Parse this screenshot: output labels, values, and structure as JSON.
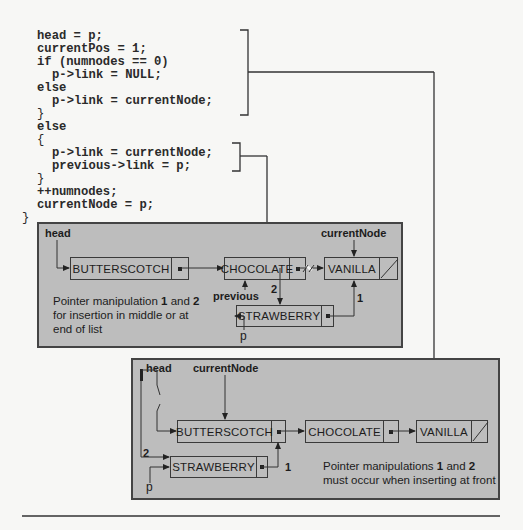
{
  "code": {
    "lines": [
      {
        "text": "head = p;",
        "indent": 1
      },
      {
        "text": "currentPos = 1;",
        "indent": 1
      },
      {
        "text": "if (numnodes == 0)",
        "indent": 1
      },
      {
        "text": "p->link = NULL;",
        "indent": 2
      },
      {
        "text": "else",
        "indent": 1
      },
      {
        "text": "p->link = currentNode;",
        "indent": 2
      },
      {
        "text": "}",
        "indent": 0
      },
      {
        "text": "else",
        "indent": 0
      },
      {
        "text": "{",
        "indent": 0
      },
      {
        "text": "p->link = currentNode;",
        "indent": 1
      },
      {
        "text": "previous->link = p;",
        "indent": 1
      },
      {
        "text": "}",
        "indent": 0
      },
      {
        "text": "++numnodes;",
        "indent": 0
      },
      {
        "text": "currentNode = p;",
        "indent": 0
      },
      {
        "text": "}",
        "indent": -1
      }
    ]
  },
  "middle_insert": {
    "head_label": "head",
    "current_node_label": "currentNode",
    "previous_label": "previous",
    "p_label": "p",
    "nodes": {
      "butterscotch": "BUTTERSCOTCH",
      "chocolate": "CHOCOLATE",
      "vanilla": "VANILLA",
      "strawberry": "STRAWBERRY"
    },
    "step_1": "1",
    "step_2": "2",
    "note": {
      "line1_pre": "Pointer manipulation ",
      "line1_b1": "1",
      "line1_mid": " and ",
      "line1_b2": "2",
      "line2": "for insertion in middle or at",
      "line3": "end of list"
    }
  },
  "front_insert": {
    "head_label": "head",
    "current_node_label": "currentNode",
    "p_label": "p",
    "nodes": {
      "butterscotch": "BUTTERSCOTCH",
      "chocolate": "CHOCOLATE",
      "vanilla": "VANILLA",
      "strawberry": "STRAWBERRY"
    },
    "step_1": "1",
    "step_2": "2",
    "note": {
      "line1_pre": "Pointer manipulations ",
      "line1_b1": "1",
      "line1_mid": " and ",
      "line1_b2": "2",
      "line2": "must occur when inserting at front"
    }
  },
  "colors": {
    "panel_bg": "#bdbdbd",
    "line": "#333333",
    "page_bg": "#f7f7f5"
  }
}
